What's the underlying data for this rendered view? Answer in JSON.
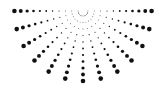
{
  "graphic": {
    "name": "half-sunburst-dot-pattern",
    "center": [
      83,
      11
    ],
    "ray_count": 13,
    "start_angle_deg": 0,
    "end_angle_deg": 180,
    "dots_per_ray": 11,
    "inner_radius": 5,
    "outer_radius": 70,
    "min_dot_radius": 0.4,
    "max_dot_radius": 2.3,
    "dot_color": "#111111",
    "background": "#ffffff"
  }
}
